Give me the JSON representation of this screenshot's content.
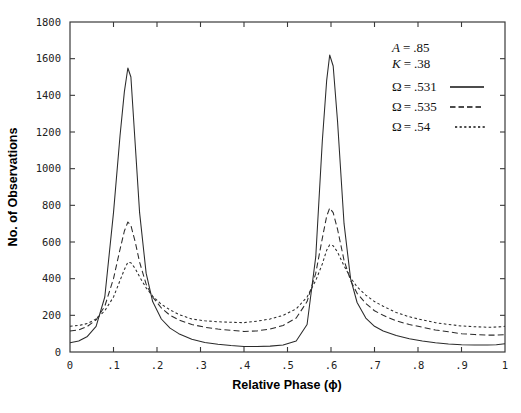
{
  "chart_data": {
    "type": "line",
    "title": "",
    "xlabel": "Relative Phase (ϕ)",
    "ylabel": "No. of Observations",
    "xlim": [
      0,
      1
    ],
    "ylim": [
      0,
      1800
    ],
    "grid": false,
    "legend_position": "top-right",
    "xticks": [
      0,
      0.1,
      0.2,
      0.3,
      0.4,
      0.5,
      0.6,
      0.7,
      0.8,
      0.9,
      1
    ],
    "xtick_labels": [
      "0",
      ".1",
      ".2",
      ".3",
      ".4",
      ".5",
      ".6",
      ".7",
      ".8",
      ".9",
      "1"
    ],
    "yticks": [
      0,
      200,
      400,
      600,
      800,
      1000,
      1200,
      1400,
      1600,
      1800
    ],
    "ytick_labels": [
      "0",
      "200",
      "400",
      "600",
      "800",
      "1000",
      "1200",
      "1400",
      "1600",
      "1800"
    ],
    "annotations": [
      {
        "name": "param-A",
        "label": "A",
        "equals": "=",
        "value": ".85"
      },
      {
        "name": "param-K",
        "label": "K",
        "equals": "=",
        "value": ".38"
      }
    ],
    "x": [
      0.0,
      0.02,
      0.04,
      0.06,
      0.08,
      0.1,
      0.115,
      0.125,
      0.133,
      0.14,
      0.15,
      0.16,
      0.175,
      0.19,
      0.21,
      0.23,
      0.25,
      0.28,
      0.31,
      0.34,
      0.37,
      0.4,
      0.43,
      0.46,
      0.49,
      0.52,
      0.545,
      0.565,
      0.58,
      0.59,
      0.597,
      0.605,
      0.615,
      0.63,
      0.645,
      0.66,
      0.68,
      0.7,
      0.72,
      0.75,
      0.78,
      0.81,
      0.84,
      0.87,
      0.9,
      0.93,
      0.96,
      0.98,
      1.0
    ],
    "series": [
      {
        "name": "Ω = .531",
        "omega": 0.531,
        "style": "solid",
        "legend_label_symbol": "Ω",
        "legend_label_equals": "=",
        "legend_label_value": ".531",
        "values": [
          50,
          60,
          85,
          140,
          300,
          760,
          1180,
          1420,
          1549,
          1500,
          1130,
          760,
          430,
          275,
          180,
          130,
          100,
          70,
          52,
          42,
          35,
          30,
          30,
          32,
          38,
          60,
          150,
          520,
          1150,
          1480,
          1620,
          1560,
          1260,
          700,
          400,
          270,
          185,
          140,
          115,
          90,
          72,
          60,
          50,
          44,
          40,
          38,
          38,
          40,
          45
        ]
      },
      {
        "name": "Ω = .535",
        "omega": 0.535,
        "style": "dashed",
        "legend_label_symbol": "Ω",
        "legend_label_equals": "=",
        "legend_label_value": ".535",
        "values": [
          115,
          120,
          140,
          175,
          250,
          400,
          560,
          660,
          709,
          690,
          600,
          490,
          370,
          300,
          240,
          200,
          175,
          150,
          135,
          125,
          118,
          112,
          115,
          125,
          145,
          185,
          275,
          430,
          620,
          740,
          785,
          760,
          670,
          500,
          390,
          320,
          265,
          225,
          200,
          170,
          150,
          135,
          120,
          110,
          100,
          95,
          92,
          92,
          95
        ]
      },
      {
        "name": "Ω = .54",
        "omega": 0.54,
        "style": "dotted",
        "legend_label_symbol": "Ω",
        "legend_label_equals": "=",
        "legend_label_value": ".54",
        "values": [
          140,
          145,
          155,
          180,
          225,
          300,
          390,
          450,
          490,
          487,
          455,
          410,
          350,
          305,
          260,
          230,
          205,
          180,
          170,
          165,
          162,
          160,
          168,
          180,
          200,
          235,
          300,
          390,
          480,
          555,
          585,
          580,
          545,
          470,
          405,
          355,
          310,
          275,
          250,
          215,
          192,
          175,
          160,
          150,
          142,
          138,
          135,
          136,
          140
        ]
      }
    ]
  }
}
